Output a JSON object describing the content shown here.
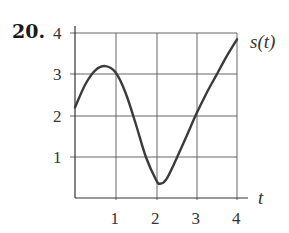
{
  "problem": {
    "number": "20."
  },
  "chart_data": {
    "type": "line",
    "title": "",
    "xlabel": "t",
    "ylabel": "",
    "series": [
      {
        "name": "s(t)",
        "x": [
          0,
          0.25,
          0.5,
          0.75,
          1.0,
          1.25,
          1.5,
          1.75,
          2.0,
          2.1,
          2.25,
          2.5,
          2.75,
          3.0,
          3.25,
          3.5,
          3.75,
          4.0
        ],
        "values": [
          2.2,
          2.75,
          3.1,
          3.2,
          3.05,
          2.55,
          1.8,
          1.0,
          0.45,
          0.35,
          0.45,
          0.95,
          1.5,
          2.05,
          2.55,
          3.0,
          3.45,
          3.85
        ]
      }
    ],
    "xticks": [
      "1",
      "2",
      "3",
      "4"
    ],
    "yticks": [
      "1",
      "2",
      "3",
      "4"
    ],
    "xlim": [
      0,
      4
    ],
    "ylim": [
      0,
      4
    ],
    "grid": true,
    "legend": "curve label s(t) at upper right end of curve",
    "curve_label": "s(t)"
  }
}
